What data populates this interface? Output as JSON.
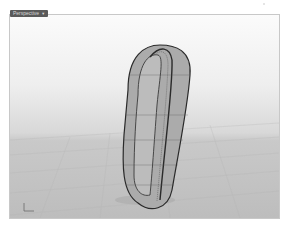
{
  "viewport": {
    "label": "Perspective",
    "dropdown_icon": "triangle-down",
    "display_mode": "shaded",
    "background_top": "#fbfbfb",
    "background_bottom": "#bdbdbd"
  },
  "scene": {
    "object": "curved tube / loop surface",
    "surface_color": "#a9a9a9",
    "edge_color": "#2a2a2a"
  },
  "axis_widget": {
    "axes": [
      "x",
      "y",
      "z"
    ],
    "color": "#6a6a6a"
  }
}
